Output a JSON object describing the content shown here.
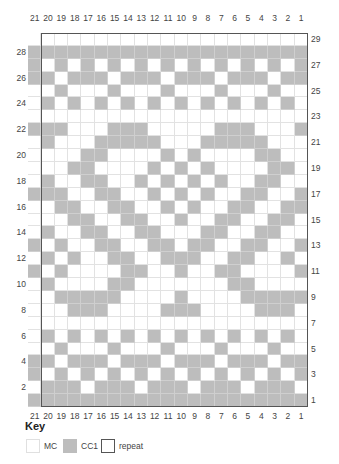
{
  "chart_data": {
    "type": "heatmap",
    "columns": [
      21,
      20,
      19,
      18,
      17,
      16,
      15,
      14,
      13,
      12,
      11,
      10,
      9,
      8,
      7,
      6,
      5,
      4,
      3,
      2,
      1
    ],
    "rows_top_to_bottom": [
      29,
      28,
      27,
      26,
      25,
      24,
      23,
      22,
      21,
      20,
      19,
      18,
      17,
      16,
      15,
      14,
      13,
      12,
      11,
      10,
      9,
      8,
      7,
      6,
      5,
      4,
      3,
      2,
      1
    ],
    "left_row_labels": [
      28,
      26,
      24,
      22,
      20,
      18,
      16,
      14,
      12,
      10,
      8,
      6,
      4,
      2
    ],
    "right_row_labels": [
      29,
      27,
      25,
      23,
      21,
      19,
      17,
      15,
      13,
      11,
      9,
      7,
      5,
      3,
      1
    ],
    "legend": {
      "0": "MC",
      "1": "CC1"
    },
    "repeat": {
      "columns": "20-1",
      "rows": "1-29"
    },
    "cells_top_to_bottom": [
      [
        0,
        0,
        0,
        0,
        0,
        0,
        0,
        0,
        0,
        0,
        0,
        0,
        0,
        0,
        0,
        0,
        0,
        0,
        0,
        0,
        0
      ],
      [
        1,
        1,
        1,
        1,
        1,
        1,
        1,
        1,
        1,
        1,
        1,
        1,
        1,
        1,
        1,
        1,
        1,
        1,
        1,
        1,
        1
      ],
      [
        1,
        0,
        1,
        0,
        1,
        0,
        1,
        0,
        1,
        0,
        1,
        0,
        1,
        0,
        1,
        0,
        1,
        0,
        1,
        0,
        1
      ],
      [
        1,
        1,
        0,
        1,
        1,
        1,
        0,
        1,
        1,
        1,
        0,
        1,
        1,
        1,
        0,
        1,
        1,
        1,
        0,
        1,
        1
      ],
      [
        0,
        0,
        1,
        0,
        0,
        0,
        1,
        0,
        0,
        0,
        1,
        0,
        0,
        0,
        1,
        0,
        0,
        0,
        1,
        0,
        0
      ],
      [
        0,
        1,
        0,
        1,
        0,
        1,
        0,
        1,
        0,
        1,
        0,
        1,
        0,
        1,
        0,
        1,
        0,
        1,
        0,
        1,
        0
      ],
      [
        0,
        0,
        0,
        0,
        0,
        0,
        0,
        0,
        0,
        0,
        0,
        0,
        0,
        0,
        0,
        0,
        0,
        0,
        0,
        0,
        0
      ],
      [
        1,
        1,
        1,
        0,
        0,
        0,
        1,
        1,
        1,
        0,
        0,
        0,
        0,
        0,
        1,
        1,
        1,
        0,
        0,
        0,
        1
      ],
      [
        0,
        1,
        0,
        0,
        0,
        1,
        1,
        1,
        1,
        1,
        0,
        0,
        0,
        1,
        1,
        1,
        1,
        1,
        0,
        0,
        0
      ],
      [
        0,
        0,
        0,
        0,
        1,
        1,
        0,
        0,
        0,
        0,
        1,
        0,
        1,
        0,
        0,
        0,
        0,
        1,
        1,
        0,
        0
      ],
      [
        0,
        0,
        0,
        1,
        1,
        0,
        0,
        0,
        0,
        1,
        0,
        1,
        0,
        1,
        0,
        0,
        0,
        0,
        1,
        1,
        0
      ],
      [
        0,
        1,
        0,
        0,
        1,
        1,
        0,
        0,
        1,
        0,
        1,
        0,
        1,
        0,
        1,
        0,
        0,
        1,
        1,
        0,
        0
      ],
      [
        1,
        1,
        1,
        0,
        0,
        1,
        1,
        0,
        0,
        1,
        0,
        1,
        0,
        1,
        0,
        0,
        1,
        1,
        0,
        0,
        1
      ],
      [
        0,
        0,
        1,
        1,
        0,
        0,
        1,
        1,
        0,
        0,
        1,
        0,
        1,
        0,
        0,
        1,
        1,
        0,
        0,
        1,
        1
      ],
      [
        0,
        0,
        0,
        1,
        1,
        0,
        0,
        1,
        1,
        0,
        0,
        1,
        0,
        0,
        1,
        1,
        0,
        0,
        1,
        1,
        0
      ],
      [
        0,
        1,
        0,
        0,
        1,
        1,
        0,
        0,
        1,
        1,
        0,
        0,
        0,
        1,
        1,
        0,
        0,
        1,
        1,
        0,
        0
      ],
      [
        1,
        0,
        1,
        0,
        0,
        1,
        1,
        0,
        0,
        1,
        1,
        0,
        1,
        1,
        0,
        0,
        1,
        1,
        0,
        0,
        1
      ],
      [
        0,
        1,
        0,
        1,
        0,
        0,
        1,
        1,
        0,
        0,
        1,
        1,
        1,
        0,
        0,
        1,
        1,
        0,
        0,
        1,
        0
      ],
      [
        1,
        0,
        1,
        0,
        0,
        0,
        0,
        1,
        1,
        0,
        0,
        1,
        0,
        0,
        1,
        1,
        0,
        0,
        0,
        0,
        1
      ],
      [
        0,
        1,
        0,
        0,
        0,
        0,
        1,
        1,
        0,
        0,
        0,
        0,
        0,
        0,
        0,
        1,
        1,
        0,
        0,
        0,
        0
      ],
      [
        0,
        0,
        1,
        1,
        1,
        1,
        1,
        0,
        0,
        0,
        0,
        1,
        0,
        0,
        0,
        0,
        1,
        1,
        1,
        1,
        1
      ],
      [
        0,
        0,
        0,
        1,
        1,
        1,
        0,
        0,
        0,
        0,
        1,
        1,
        1,
        0,
        0,
        0,
        0,
        1,
        1,
        1,
        0
      ],
      [
        0,
        0,
        0,
        0,
        0,
        0,
        0,
        0,
        0,
        0,
        0,
        0,
        0,
        0,
        0,
        0,
        0,
        0,
        0,
        0,
        0
      ],
      [
        0,
        1,
        0,
        1,
        0,
        1,
        0,
        1,
        0,
        1,
        0,
        1,
        0,
        1,
        0,
        1,
        0,
        1,
        0,
        1,
        0
      ],
      [
        0,
        0,
        1,
        0,
        0,
        0,
        1,
        0,
        0,
        0,
        1,
        0,
        0,
        0,
        1,
        0,
        0,
        0,
        1,
        0,
        0
      ],
      [
        1,
        1,
        0,
        1,
        1,
        1,
        0,
        1,
        1,
        1,
        0,
        1,
        1,
        1,
        0,
        1,
        1,
        1,
        0,
        1,
        1
      ],
      [
        1,
        0,
        1,
        0,
        1,
        0,
        1,
        0,
        1,
        0,
        1,
        0,
        1,
        0,
        1,
        0,
        1,
        0,
        1,
        0,
        1
      ],
      [
        0,
        1,
        1,
        1,
        0,
        1,
        1,
        1,
        0,
        1,
        1,
        1,
        0,
        1,
        1,
        1,
        0,
        1,
        1,
        1,
        0
      ],
      [
        1,
        1,
        1,
        1,
        1,
        1,
        1,
        1,
        1,
        1,
        1,
        1,
        1,
        1,
        1,
        1,
        1,
        1,
        1,
        1,
        1
      ]
    ]
  },
  "colors": {
    "mc": "#ffffff",
    "cc1": "#bdbdbd",
    "grid_line": "#e2e2e2",
    "repeat_border": "#555555"
  },
  "key": {
    "title": "Key",
    "items": [
      {
        "label": "MC",
        "swatch": "mc"
      },
      {
        "label": "CC1",
        "swatch": "cc1"
      },
      {
        "label": "repeat",
        "swatch": "repeat"
      }
    ]
  }
}
